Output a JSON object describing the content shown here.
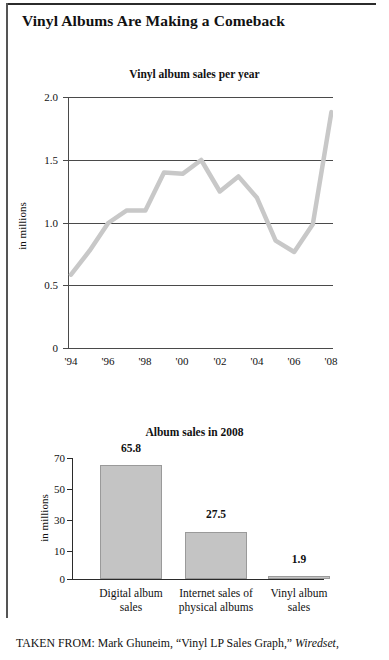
{
  "page": {
    "headline": "Vinyl Albums Are Making a Comeback",
    "caption_prefix": "TAKEN FROM: Mark Ghuneim, “Vinyl LP Sales Graph,” ",
    "caption_source": "Wiredset",
    "caption_suffix": ",",
    "rule_color": "#2b2b2b",
    "line_color": "#c8c8c8",
    "bar_fill": "#c4c4c4",
    "bar_stroke": "#9a9a9a"
  },
  "chart_data": [
    {
      "type": "line",
      "title": "Vinyl album sales per year",
      "xlabel": "",
      "ylabel": "in millions",
      "ylim": [
        0,
        2.0
      ],
      "yticks": [
        0,
        0.5,
        1.0,
        1.5,
        2.0
      ],
      "ytick_labels": [
        "0",
        "0.5",
        "1.0",
        "1.5",
        "2.0"
      ],
      "xtick_labels": [
        "'94",
        "'96",
        "'98",
        "'00",
        "'02",
        "'04",
        "'06",
        "'08"
      ],
      "grid": true,
      "legend": "none",
      "x": [
        "'94",
        "'95",
        "'96",
        "'97",
        "'98",
        "'99",
        "'00",
        "'01",
        "'02",
        "'03",
        "'04",
        "'05",
        "'06",
        "'07",
        "'08"
      ],
      "values": [
        0.59,
        0.78,
        1.0,
        1.1,
        1.1,
        1.4,
        1.39,
        1.5,
        1.25,
        1.37,
        1.2,
        0.86,
        0.77,
        0.99,
        1.88
      ]
    },
    {
      "type": "bar",
      "title": "Album sales in 2008",
      "xlabel": "",
      "ylabel": "in millions",
      "ylim": [
        0,
        70
      ],
      "yticks": [
        0,
        10,
        30,
        50,
        70
      ],
      "ytick_labels": [
        "0",
        "10",
        "30",
        "50",
        "70"
      ],
      "grid": false,
      "legend": "none",
      "categories": [
        "Digital album sales",
        "Internet sales of physical albums",
        "Vinyl album sales"
      ],
      "category_lines": [
        [
          "Digital album",
          "sales"
        ],
        [
          "Internet sales of",
          "physical albums"
        ],
        [
          "Vinyl album",
          "sales"
        ]
      ],
      "values": [
        65.8,
        27.5,
        1.9
      ],
      "value_labels": [
        "65.8",
        "27.5",
        "1.9"
      ]
    }
  ]
}
